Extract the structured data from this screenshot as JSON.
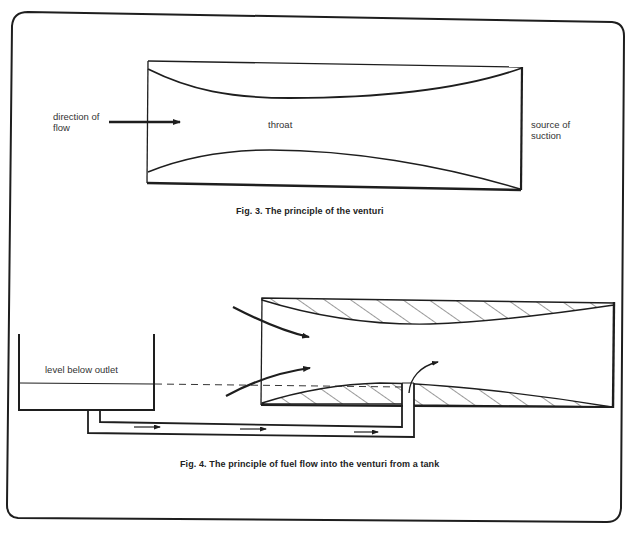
{
  "figure3": {
    "caption": "Fig. 3. The principle of the venturi",
    "labels": {
      "direction_line1": "direction of",
      "direction_line2": "flow",
      "throat": "throat",
      "suction_line1": "source of",
      "suction_line2": "suction"
    }
  },
  "figure4": {
    "caption": "Fig. 4. The principle of fuel flow into the venturi from a tank",
    "labels": {
      "tank_level": "level below outlet"
    }
  },
  "colors": {
    "ink": "#1e1e1e",
    "paper": "#ffffff",
    "text": "#333333"
  }
}
